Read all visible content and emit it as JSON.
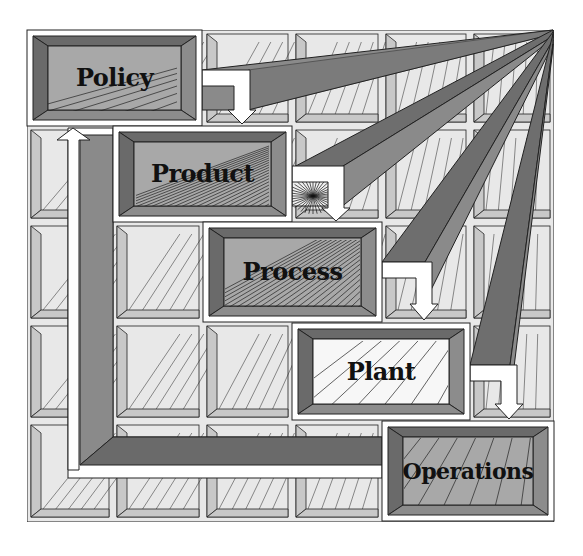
{
  "diagram": {
    "type": "hierarchy-cascade",
    "vanishing_point": {
      "x": 553,
      "y": 30
    },
    "colors": {
      "background": "#ffffff",
      "grid_face": "#e8e8e8",
      "grid_bevel": "#c8c8c8",
      "frame_dark": "#6a6a6a",
      "frame_mid": "#8c8c8c",
      "face_gray": "#a8a8a8",
      "face_white": "#f7f7f7",
      "beam_dark": "#6e6e6e",
      "beam_mid": "#8a8a8a",
      "line": "#222222",
      "arrow": "#ffffff"
    },
    "boxes": [
      {
        "id": "policy",
        "label": "Policy",
        "frame": {
          "x": 27,
          "y": 30,
          "w": 175,
          "h": 96
        },
        "face": "gray"
      },
      {
        "id": "product",
        "label": "Product",
        "frame": {
          "x": 113,
          "y": 126,
          "w": 179,
          "h": 96
        },
        "face": "gray"
      },
      {
        "id": "process",
        "label": "Process",
        "frame": {
          "x": 203,
          "y": 222,
          "w": 179,
          "h": 100
        },
        "face": "gray"
      },
      {
        "id": "plant",
        "label": "Plant",
        "frame": {
          "x": 292,
          "y": 323,
          "w": 178,
          "h": 97
        },
        "face": "white"
      },
      {
        "id": "operations",
        "label": "Operations",
        "frame": {
          "x": 382,
          "y": 421,
          "w": 172,
          "h": 100
        },
        "face": "gray"
      }
    ],
    "flows": [
      {
        "from": "policy",
        "to": "product",
        "direction": "down"
      },
      {
        "from": "product",
        "to": "process",
        "direction": "down"
      },
      {
        "from": "process",
        "to": "plant",
        "direction": "down"
      },
      {
        "from": "plant",
        "to": "operations",
        "direction": "down"
      },
      {
        "from": "operations",
        "to": "policy",
        "direction": "feedback-up"
      }
    ]
  }
}
